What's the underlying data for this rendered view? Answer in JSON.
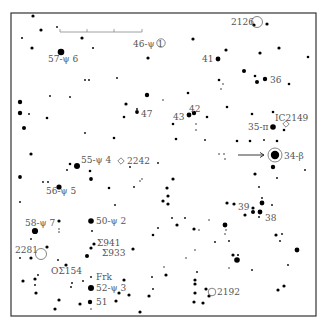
{
  "chart": {
    "frame": {
      "x": 11,
      "y": 13,
      "w": 305,
      "h": 303
    },
    "scale_bar": {
      "x1": 60,
      "x2": 142,
      "y": 32,
      "ticks": [
        60,
        87,
        114,
        142
      ]
    },
    "stars": [
      {
        "x": 33,
        "y": 16,
        "r": 1.6
      },
      {
        "x": 41,
        "y": 30,
        "r": 1.6
      },
      {
        "x": 57,
        "y": 27,
        "r": 0.9
      },
      {
        "x": 22,
        "y": 38,
        "r": 1.0
      },
      {
        "x": 32,
        "y": 48,
        "r": 1.6
      },
      {
        "x": 61,
        "y": 52,
        "r": 3.3
      },
      {
        "x": 82,
        "y": 38,
        "r": 1.6
      },
      {
        "x": 93,
        "y": 48,
        "r": 1.0
      },
      {
        "x": 148,
        "y": 58,
        "r": 1.6
      },
      {
        "x": 85,
        "y": 80,
        "r": 0.9
      },
      {
        "x": 89,
        "y": 80,
        "r": 0.9
      },
      {
        "x": 117,
        "y": 78,
        "r": 0.9
      },
      {
        "x": 50,
        "y": 96,
        "r": 0.9
      },
      {
        "x": 70,
        "y": 97,
        "r": 0.9
      },
      {
        "x": 20,
        "y": 102,
        "r": 2.2
      },
      {
        "x": 147,
        "y": 95,
        "r": 2.2
      },
      {
        "x": 126,
        "y": 104,
        "r": 1.6
      },
      {
        "x": 137,
        "y": 109,
        "r": 0.9
      },
      {
        "x": 254,
        "y": 25,
        "r": 1.6
      },
      {
        "x": 267,
        "y": 24,
        "r": 1.6
      },
      {
        "x": 193,
        "y": 39,
        "r": 1.6
      },
      {
        "x": 226,
        "y": 50,
        "r": 1.6
      },
      {
        "x": 260,
        "y": 53,
        "r": 1.6
      },
      {
        "x": 279,
        "y": 48,
        "r": 1.6
      },
      {
        "x": 308,
        "y": 57,
        "r": 1.3
      },
      {
        "x": 218,
        "y": 59,
        "r": 2.4
      },
      {
        "x": 244,
        "y": 71,
        "r": 2.0
      },
      {
        "x": 255,
        "y": 76,
        "r": 1.3
      },
      {
        "x": 265,
        "y": 79,
        "r": 2.2
      },
      {
        "x": 257,
        "y": 82,
        "r": 2.0
      },
      {
        "x": 219,
        "y": 80,
        "r": 1.3
      },
      {
        "x": 223,
        "y": 84,
        "r": 0.7
      },
      {
        "x": 221,
        "y": 89,
        "r": 0.7
      },
      {
        "x": 289,
        "y": 84,
        "r": 1.3
      },
      {
        "x": 188,
        "y": 93,
        "r": 1.3
      },
      {
        "x": 163,
        "y": 100,
        "r": 0.7
      },
      {
        "x": 227,
        "y": 107,
        "r": 1.3
      },
      {
        "x": 20,
        "y": 113,
        "r": 2.2
      },
      {
        "x": 29,
        "y": 114,
        "r": 0.9
      },
      {
        "x": 47,
        "y": 118,
        "r": 1.3
      },
      {
        "x": 24,
        "y": 128,
        "r": 2.0
      },
      {
        "x": 124,
        "y": 117,
        "r": 1.3
      },
      {
        "x": 137,
        "y": 112,
        "r": 1.9
      },
      {
        "x": 85,
        "y": 133,
        "r": 0.9
      },
      {
        "x": 114,
        "y": 138,
        "r": 1.3
      },
      {
        "x": 31,
        "y": 154,
        "r": 1.6
      },
      {
        "x": 70,
        "y": 164,
        "r": 1.3
      },
      {
        "x": 77,
        "y": 166,
        "r": 3.0
      },
      {
        "x": 67,
        "y": 170,
        "r": 0.9
      },
      {
        "x": 90,
        "y": 171,
        "r": 1.3
      },
      {
        "x": 91,
        "y": 179,
        "r": 1.9
      },
      {
        "x": 20,
        "y": 177,
        "r": 1.9
      },
      {
        "x": 43,
        "y": 182,
        "r": 0.9
      },
      {
        "x": 48,
        "y": 182,
        "r": 0.9
      },
      {
        "x": 59,
        "y": 187,
        "r": 2.6
      },
      {
        "x": 109,
        "y": 188,
        "r": 1.3
      },
      {
        "x": 130,
        "y": 167,
        "r": 0.9
      },
      {
        "x": 140,
        "y": 181,
        "r": 0.7
      },
      {
        "x": 142,
        "y": 179,
        "r": 0.7
      },
      {
        "x": 134,
        "y": 187,
        "r": 0.9
      },
      {
        "x": 20,
        "y": 202,
        "r": 0.9
      },
      {
        "x": 115,
        "y": 205,
        "r": 0.9
      },
      {
        "x": 158,
        "y": 163,
        "r": 0.9
      },
      {
        "x": 189,
        "y": 115,
        "r": 2.4
      },
      {
        "x": 194,
        "y": 113,
        "r": 2.2
      },
      {
        "x": 207,
        "y": 117,
        "r": 1.3
      },
      {
        "x": 173,
        "y": 124,
        "r": 1.3
      },
      {
        "x": 196,
        "y": 124,
        "r": 0.7
      },
      {
        "x": 196,
        "y": 130,
        "r": 0.7
      },
      {
        "x": 176,
        "y": 139,
        "r": 1.3
      },
      {
        "x": 205,
        "y": 140,
        "r": 0.9
      },
      {
        "x": 252,
        "y": 114,
        "r": 1.3
      },
      {
        "x": 273,
        "y": 112,
        "r": 1.3
      },
      {
        "x": 273,
        "y": 127,
        "r": 2.8
      },
      {
        "x": 284,
        "y": 130,
        "r": 1.3
      },
      {
        "x": 237,
        "y": 141,
        "r": 1.3
      },
      {
        "x": 250,
        "y": 141,
        "r": 1.3
      },
      {
        "x": 264,
        "y": 140,
        "r": 0.9
      },
      {
        "x": 277,
        "y": 141,
        "r": 1.3
      },
      {
        "x": 219,
        "y": 154,
        "r": 0.7
      },
      {
        "x": 224,
        "y": 154,
        "r": 0.7
      },
      {
        "x": 225,
        "y": 159,
        "r": 0.7
      },
      {
        "x": 275,
        "y": 155,
        "r": 4.2
      },
      {
        "x": 273,
        "y": 167,
        "r": 2.2
      },
      {
        "x": 255,
        "y": 174,
        "r": 1.6
      },
      {
        "x": 305,
        "y": 170,
        "r": 0.9
      },
      {
        "x": 277,
        "y": 178,
        "r": 0.9
      },
      {
        "x": 173,
        "y": 179,
        "r": 1.6
      },
      {
        "x": 167,
        "y": 188,
        "r": 1.6
      },
      {
        "x": 168,
        "y": 196,
        "r": 1.6
      },
      {
        "x": 259,
        "y": 187,
        "r": 0.9
      },
      {
        "x": 163,
        "y": 201,
        "r": 1.6
      },
      {
        "x": 168,
        "y": 204,
        "r": 1.6
      },
      {
        "x": 262,
        "y": 198,
        "r": 0.9
      },
      {
        "x": 262,
        "y": 203,
        "r": 2.4
      },
      {
        "x": 227,
        "y": 203,
        "r": 1.6
      },
      {
        "x": 234,
        "y": 204,
        "r": 1.6
      },
      {
        "x": 272,
        "y": 205,
        "r": 0.9
      },
      {
        "x": 253,
        "y": 208,
        "r": 1.6
      },
      {
        "x": 253,
        "y": 212,
        "r": 2.0
      },
      {
        "x": 260,
        "y": 212,
        "r": 2.4
      },
      {
        "x": 245,
        "y": 215,
        "r": 1.6
      },
      {
        "x": 259,
        "y": 217,
        "r": 0.9
      },
      {
        "x": 185,
        "y": 218,
        "r": 0.9
      },
      {
        "x": 172,
        "y": 218,
        "r": 0.9
      },
      {
        "x": 158,
        "y": 228,
        "r": 0.9
      },
      {
        "x": 59,
        "y": 221,
        "r": 1.6
      },
      {
        "x": 91,
        "y": 221,
        "r": 2.8
      },
      {
        "x": 35,
        "y": 231,
        "r": 3.1
      },
      {
        "x": 59,
        "y": 229,
        "r": 0.7
      },
      {
        "x": 59,
        "y": 232,
        "r": 0.7
      },
      {
        "x": 92,
        "y": 231,
        "r": 0.9
      },
      {
        "x": 153,
        "y": 235,
        "r": 1.3
      },
      {
        "x": 31,
        "y": 239,
        "r": 0.9
      },
      {
        "x": 47,
        "y": 247,
        "r": 1.6
      },
      {
        "x": 94,
        "y": 244,
        "r": 1.6
      },
      {
        "x": 91,
        "y": 248,
        "r": 1.6
      },
      {
        "x": 133,
        "y": 249,
        "r": 1.6
      },
      {
        "x": 87,
        "y": 256,
        "r": 2.0
      },
      {
        "x": 20,
        "y": 258,
        "r": 0.9
      },
      {
        "x": 31,
        "y": 258,
        "r": 1.6
      },
      {
        "x": 58,
        "y": 260,
        "r": 0.9
      },
      {
        "x": 66,
        "y": 265,
        "r": 1.6
      },
      {
        "x": 91,
        "y": 277,
        "r": 0.9
      },
      {
        "x": 38,
        "y": 275,
        "r": 0.9
      },
      {
        "x": 35,
        "y": 279,
        "r": 1.6
      },
      {
        "x": 23,
        "y": 281,
        "r": 1.6
      },
      {
        "x": 35,
        "y": 285,
        "r": 0.9
      },
      {
        "x": 72,
        "y": 283,
        "r": 0.9
      },
      {
        "x": 71,
        "y": 287,
        "r": 0.9
      },
      {
        "x": 83,
        "y": 281,
        "r": 0.9
      },
      {
        "x": 124,
        "y": 280,
        "r": 1.6
      },
      {
        "x": 119,
        "y": 293,
        "r": 1.6
      },
      {
        "x": 129,
        "y": 295,
        "r": 1.6
      },
      {
        "x": 91,
        "y": 288,
        "r": 3.0
      },
      {
        "x": 36,
        "y": 293,
        "r": 1.6
      },
      {
        "x": 152,
        "y": 277,
        "r": 0.9
      },
      {
        "x": 153,
        "y": 289,
        "r": 0.9
      },
      {
        "x": 149,
        "y": 296,
        "r": 1.6
      },
      {
        "x": 59,
        "y": 300,
        "r": 1.6
      },
      {
        "x": 80,
        "y": 304,
        "r": 1.6
      },
      {
        "x": 116,
        "y": 301,
        "r": 1.6
      },
      {
        "x": 90,
        "y": 302,
        "r": 2.2
      },
      {
        "x": 55,
        "y": 309,
        "r": 1.6
      },
      {
        "x": 91,
        "y": 309,
        "r": 0.7
      },
      {
        "x": 140,
        "y": 312,
        "r": 1.6
      },
      {
        "x": 177,
        "y": 225,
        "r": 1.6
      },
      {
        "x": 194,
        "y": 229,
        "r": 1.6
      },
      {
        "x": 209,
        "y": 220,
        "r": 0.7
      },
      {
        "x": 225,
        "y": 225,
        "r": 2.4
      },
      {
        "x": 215,
        "y": 242,
        "r": 0.9
      },
      {
        "x": 229,
        "y": 241,
        "r": 0.9
      },
      {
        "x": 233,
        "y": 255,
        "r": 1.6
      },
      {
        "x": 238,
        "y": 255,
        "r": 1.0
      },
      {
        "x": 237,
        "y": 260,
        "r": 2.8
      },
      {
        "x": 226,
        "y": 230,
        "r": 0.7
      },
      {
        "x": 225,
        "y": 234,
        "r": 0.7
      },
      {
        "x": 199,
        "y": 230,
        "r": 0.7
      },
      {
        "x": 195,
        "y": 250,
        "r": 0.7
      },
      {
        "x": 186,
        "y": 258,
        "r": 0.7
      },
      {
        "x": 164,
        "y": 267,
        "r": 0.7
      },
      {
        "x": 166,
        "y": 275,
        "r": 1.6
      },
      {
        "x": 229,
        "y": 268,
        "r": 0.7
      },
      {
        "x": 252,
        "y": 270,
        "r": 0.9
      },
      {
        "x": 197,
        "y": 272,
        "r": 0.9
      },
      {
        "x": 276,
        "y": 235,
        "r": 1.6
      },
      {
        "x": 282,
        "y": 234,
        "r": 0.9
      },
      {
        "x": 280,
        "y": 241,
        "r": 0.9
      },
      {
        "x": 297,
        "y": 250,
        "r": 2.4
      },
      {
        "x": 288,
        "y": 265,
        "r": 0.9
      },
      {
        "x": 195,
        "y": 280,
        "r": 1.6
      },
      {
        "x": 195,
        "y": 284,
        "r": 1.6
      },
      {
        "x": 206,
        "y": 289,
        "r": 1.6
      },
      {
        "x": 195,
        "y": 293,
        "r": 1.6
      },
      {
        "x": 209,
        "y": 296,
        "r": 1.6
      },
      {
        "x": 194,
        "y": 302,
        "r": 1.6
      },
      {
        "x": 203,
        "y": 303,
        "r": 1.6
      },
      {
        "x": 278,
        "y": 290,
        "r": 1.6
      },
      {
        "x": 284,
        "y": 286,
        "r": 1.6
      }
    ],
    "rings": [
      {
        "x": 257,
        "y": 22,
        "r": 5.5
      },
      {
        "x": 275,
        "y": 155,
        "r": 7.0
      },
      {
        "x": 161,
        "y": 43,
        "r": 4.2
      },
      {
        "x": 41,
        "y": 254,
        "r": 5.5
      },
      {
        "x": 212,
        "y": 292,
        "r": 3.8
      }
    ],
    "open_markers": [
      {
        "x": 286,
        "y": 124,
        "type": "diamond"
      },
      {
        "x": 121,
        "y": 161,
        "type": "diamond"
      }
    ],
    "arrow": {
      "x1": 238,
      "y1": 155,
      "x2": 264,
      "y2": 155
    },
    "labels": [
      {
        "text": "57-ψ 6",
        "x": 48,
        "y": 62
      },
      {
        "text": "46-ψ 1",
        "x": 133,
        "y": 47
      },
      {
        "text": "2126",
        "x": 231,
        "y": 25
      },
      {
        "text": "41",
        "x": 202,
        "y": 62
      },
      {
        "text": "36",
        "x": 270,
        "y": 83
      },
      {
        "text": "47",
        "x": 141,
        "y": 117
      },
      {
        "text": "42",
        "x": 189,
        "y": 112
      },
      {
        "text": "43",
        "x": 173,
        "y": 120
      },
      {
        "text": "IC2149",
        "x": 275,
        "y": 121
      },
      {
        "text": "35-π",
        "x": 248,
        "y": 130
      },
      {
        "text": "34-β",
        "x": 284,
        "y": 159
      },
      {
        "text": "55-ψ 4",
        "x": 81,
        "y": 163
      },
      {
        "text": "2242",
        "x": 127,
        "y": 164
      },
      {
        "text": "56-ψ 5",
        "x": 46,
        "y": 194
      },
      {
        "text": "39",
        "x": 238,
        "y": 210
      },
      {
        "text": "38",
        "x": 265,
        "y": 221
      },
      {
        "text": "58-ψ 7",
        "x": 25,
        "y": 226
      },
      {
        "text": "50-ψ 2",
        "x": 96,
        "y": 224
      },
      {
        "text": "2281",
        "x": 15,
        "y": 253
      },
      {
        "text": "Σ941",
        "x": 97,
        "y": 246
      },
      {
        "text": "Σ933",
        "x": 102,
        "y": 256
      },
      {
        "text": "OΣ154",
        "x": 51,
        "y": 274
      },
      {
        "text": "Frk",
        "x": 96,
        "y": 280
      },
      {
        "text": "52-ψ 3",
        "x": 96,
        "y": 291
      },
      {
        "text": "51",
        "x": 96,
        "y": 305
      },
      {
        "text": "2192",
        "x": 217,
        "y": 295
      }
    ]
  }
}
